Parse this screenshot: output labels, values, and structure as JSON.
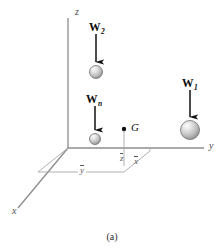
{
  "figure": {
    "caption": "(a)",
    "type": "free-body-diagram",
    "axes": [
      {
        "id": "z",
        "label": "z",
        "direction": "vertical-up",
        "label_x": 75,
        "label_y": 7
      },
      {
        "id": "y",
        "label": "y",
        "direction": "horizontal-right",
        "label_x": 209,
        "label_y": 146
      },
      {
        "id": "x",
        "label": "x",
        "direction": "diagonal-down-left",
        "label_x": 12,
        "label_y": 210
      }
    ],
    "origin": {
      "x": 68,
      "y": 148
    },
    "forces": [
      {
        "id": "W2",
        "label": "W",
        "subscript": "2",
        "label_x": 89,
        "label_y": 22,
        "arrow_x": 96,
        "arrow_y1": 34,
        "arrow_y2": 62,
        "sphere_cx": 96,
        "sphere_cy": 72,
        "sphere_r": 6.5
      },
      {
        "id": "Wn",
        "label": "W",
        "subscript": "n",
        "label_x": 86,
        "label_y": 94,
        "arrow_x": 95,
        "arrow_y1": 106,
        "arrow_y2": 130,
        "sphere_cx": 95,
        "sphere_cy": 139,
        "sphere_r": 5.5
      },
      {
        "id": "W1",
        "label": "W",
        "subscript": "1",
        "label_x": 182,
        "label_y": 78,
        "arrow_x": 190,
        "arrow_y1": 90,
        "arrow_y2": 118,
        "sphere_cx": 190,
        "sphere_cy": 130,
        "sphere_r": 9.5
      }
    ],
    "centroid": {
      "id": "G",
      "label": "G",
      "dot_x": 124,
      "dot_y": 129,
      "dot_r": 2.2,
      "label_x": 131,
      "label_y": 123
    },
    "dimensions": [
      {
        "id": "zbar",
        "label": "z",
        "overbar": true,
        "label_x": 120,
        "label_y": 155
      },
      {
        "id": "xbar",
        "label": "x",
        "overbar": true,
        "label_x": 134,
        "label_y": 158
      },
      {
        "id": "ybar",
        "label": "y",
        "overbar": true,
        "label_x": 78,
        "label_y": 167
      }
    ],
    "colors": {
      "axis_line": "#8c8c8c",
      "dimension_line": "#a8a8a8",
      "arrow": "#111111",
      "sphere_light": "#f2f2f2",
      "sphere_mid": "#c9c9c9",
      "sphere_dark": "#8f8f8f",
      "sphere_edge": "#6e6e6e",
      "text": "#1a1a1a",
      "background": "#ffffff"
    }
  }
}
